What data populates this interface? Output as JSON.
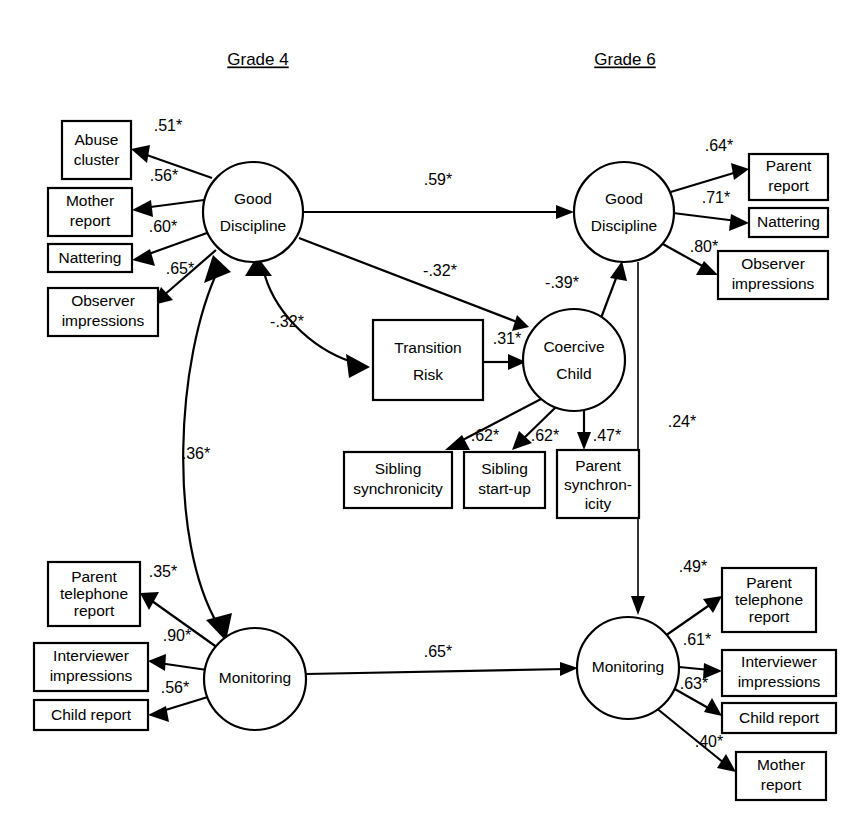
{
  "figure": {
    "type": "path-diagram"
  },
  "titles": {
    "left": "Grade 4",
    "right": "Grade 6"
  },
  "latent_variables": [
    {
      "id": "gd4",
      "label_line1": "Good",
      "label_line2": "Discipline",
      "cx": 253,
      "cy": 212,
      "r": 50,
      "grade": "Grade 4"
    },
    {
      "id": "gd6",
      "label_line1": "Good",
      "label_line2": "Discipline",
      "cx": 624,
      "cy": 212,
      "r": 50,
      "grade": "Grade 6"
    },
    {
      "id": "cc",
      "label_line1": "Coercive",
      "label_line2": "Child",
      "cx": 574,
      "cy": 360,
      "r": 51,
      "grade": "Grade 6"
    },
    {
      "id": "mon4",
      "label_line1": "Monitoring",
      "label_line2": "",
      "cx": 255,
      "cy": 679,
      "r": 51,
      "grade": "Grade 4"
    },
    {
      "id": "mon6",
      "label_line1": "Monitoring",
      "label_line2": "",
      "cx": 628,
      "cy": 668,
      "r": 51,
      "grade": "Grade 6"
    }
  ],
  "observed_variables": [
    {
      "id": "abuse_cluster",
      "lines": [
        "Abuse",
        "cluster"
      ],
      "x": 62,
      "y": 121,
      "w": 69,
      "h": 58
    },
    {
      "id": "mother_report_4",
      "lines": [
        "Mother",
        "report"
      ],
      "x": 48,
      "y": 188,
      "w": 84,
      "h": 48
    },
    {
      "id": "nattering_4",
      "lines": [
        "Nattering"
      ],
      "x": 48,
      "y": 244,
      "w": 84,
      "h": 28
    },
    {
      "id": "observer_impressions_4",
      "lines": [
        "Observer",
        "impressions"
      ],
      "x": 48,
      "y": 288,
      "w": 110,
      "h": 48
    },
    {
      "id": "parent_report_6",
      "lines": [
        "Parent",
        "report"
      ],
      "x": 749,
      "y": 154,
      "w": 79,
      "h": 46
    },
    {
      "id": "nattering_6",
      "lines": [
        "Nattering"
      ],
      "x": 749,
      "y": 208,
      "w": 79,
      "h": 29
    },
    {
      "id": "observer_impressions_6",
      "lines": [
        "Observer",
        "impressions"
      ],
      "x": 718,
      "y": 251,
      "w": 110,
      "h": 48
    },
    {
      "id": "transition_risk",
      "lines": [
        "Transition",
        "Risk"
      ],
      "x": 373,
      "y": 320,
      "w": 110,
      "h": 80
    },
    {
      "id": "sibling_synchronicity",
      "lines": [
        "Sibling",
        "synchronicity"
      ],
      "x": 344,
      "y": 452,
      "w": 108,
      "h": 56
    },
    {
      "id": "sibling_startup",
      "lines": [
        "Sibling",
        "start-up"
      ],
      "x": 464,
      "y": 452,
      "w": 81,
      "h": 56
    },
    {
      "id": "parent_synchronicity",
      "lines": [
        "Parent",
        "synchron-",
        "icity"
      ],
      "x": 557,
      "y": 450,
      "w": 82,
      "h": 68
    },
    {
      "id": "parent_telephone_report_4",
      "lines": [
        "Parent",
        "telephone",
        "report"
      ],
      "x": 48,
      "y": 562,
      "w": 92,
      "h": 64
    },
    {
      "id": "interviewer_impressions_4",
      "lines": [
        "Interviewer",
        "impressions"
      ],
      "x": 34,
      "y": 643,
      "w": 114,
      "h": 48
    },
    {
      "id": "child_report_4",
      "lines": [
        "Child report"
      ],
      "x": 34,
      "y": 700,
      "w": 114,
      "h": 30
    },
    {
      "id": "parent_telephone_report_6",
      "lines": [
        "Parent",
        "telephone",
        "report"
      ],
      "x": 722,
      "y": 568,
      "w": 94,
      "h": 64
    },
    {
      "id": "interviewer_impressions_6",
      "lines": [
        "Interviewer",
        "impressions"
      ],
      "x": 722,
      "y": 650,
      "w": 114,
      "h": 46
    },
    {
      "id": "child_report_6",
      "lines": [
        "Child report"
      ],
      "x": 722,
      "y": 703,
      "w": 114,
      "h": 30
    },
    {
      "id": "mother_report_6",
      "lines": [
        "Mother",
        "report"
      ],
      "x": 736,
      "y": 752,
      "w": 90,
      "h": 48
    }
  ],
  "paths": [
    {
      "id": "gd4-abuse",
      "coefficient": ".51*",
      "from": "gd4",
      "to": "abuse_cluster",
      "label_x": 168,
      "label_y": 127
    },
    {
      "id": "gd4-mother",
      "coefficient": ".56*",
      "from": "gd4",
      "to": "mother_report_4",
      "label_x": 164,
      "label_y": 177
    },
    {
      "id": "gd4-nattering",
      "coefficient": ".60*",
      "from": "gd4",
      "to": "nattering_4",
      "label_x": 163,
      "label_y": 228
    },
    {
      "id": "gd4-observer",
      "coefficient": ".65*",
      "from": "gd4",
      "to": "observer_impressions_4",
      "label_x": 180,
      "label_y": 270
    },
    {
      "id": "gd4-gd6",
      "coefficient": ".59*",
      "from": "gd4",
      "to": "gd6",
      "label_x": 438,
      "label_y": 181
    },
    {
      "id": "gd4-cc",
      "coefficient": "-.32*",
      "from": "gd4",
      "to": "cc",
      "label_x": 440,
      "label_y": 272
    },
    {
      "id": "gd4-transition",
      "coefficient": "-.32*",
      "from": "gd4",
      "to": "transition_risk",
      "label_x": 287,
      "label_y": 323
    },
    {
      "id": "cc-gd6",
      "coefficient": "-.39*",
      "from": "cc",
      "to": "gd6",
      "label_x": 562,
      "label_y": 284
    },
    {
      "id": "transition-cc",
      "coefficient": ".31*",
      "from": "transition_risk",
      "to": "cc",
      "label_x": 507,
      "label_y": 340
    },
    {
      "id": "gd6-parent-report",
      "coefficient": ".64*",
      "from": "gd6",
      "to": "parent_report_6",
      "label_x": 719,
      "label_y": 147
    },
    {
      "id": "gd6-nattering",
      "coefficient": ".71*",
      "from": "gd6",
      "to": "nattering_6",
      "label_x": 716,
      "label_y": 199
    },
    {
      "id": "gd6-observer",
      "coefficient": ".80*",
      "from": "gd6",
      "to": "observer_impressions_6",
      "label_x": 704,
      "label_y": 248
    },
    {
      "id": "gd6-mon6",
      "coefficient": ".24*",
      "from": "gd6",
      "to": "mon6",
      "label_x": 682,
      "label_y": 423
    },
    {
      "id": "cc-sibling-sync",
      "coefficient": ".62*",
      "from": "cc",
      "to": "sibling_synchronicity",
      "label_x": 485,
      "label_y": 437
    },
    {
      "id": "cc-sibling-startup",
      "coefficient": ".62*",
      "from": "cc",
      "to": "sibling_startup",
      "label_x": 545,
      "label_y": 437
    },
    {
      "id": "cc-parent-sync",
      "coefficient": ".47*",
      "from": "cc",
      "to": "parent_synchronicity",
      "label_x": 607,
      "label_y": 437
    },
    {
      "id": "gd4-mon4-correlation",
      "coefficient": ".36*",
      "from": "gd4",
      "to": "mon4",
      "label_x": 196,
      "label_y": 455,
      "bidirectional": true
    },
    {
      "id": "mon4-parent-phone",
      "coefficient": ".35*",
      "from": "mon4",
      "to": "parent_telephone_report_4",
      "label_x": 163,
      "label_y": 573
    },
    {
      "id": "mon4-interviewer",
      "coefficient": ".90*",
      "from": "mon4",
      "to": "interviewer_impressions_4",
      "label_x": 177,
      "label_y": 637
    },
    {
      "id": "mon4-child-report",
      "coefficient": ".56*",
      "from": "mon4",
      "to": "child_report_4",
      "label_x": 175,
      "label_y": 689
    },
    {
      "id": "mon4-mon6",
      "coefficient": ".65*",
      "from": "mon4",
      "to": "mon6",
      "label_x": 438,
      "label_y": 653
    },
    {
      "id": "mon6-parent-phone",
      "coefficient": ".49*",
      "from": "mon6",
      "to": "parent_telephone_report_6",
      "label_x": 693,
      "label_y": 568
    },
    {
      "id": "mon6-interviewer",
      "coefficient": ".61*",
      "from": "mon6",
      "to": "interviewer_impressions_6",
      "label_x": 697,
      "label_y": 641
    },
    {
      "id": "mon6-child-report",
      "coefficient": ".63*",
      "from": "mon6",
      "to": "child_report_6",
      "label_x": 694,
      "label_y": 685
    },
    {
      "id": "mon6-mother-report",
      "coefficient": ".40*",
      "from": "mon6",
      "to": "mother_report_6",
      "label_x": 709,
      "label_y": 743
    }
  ],
  "colors": {
    "stroke": "#000000",
    "background": "#ffffff",
    "text": "#000000"
  }
}
